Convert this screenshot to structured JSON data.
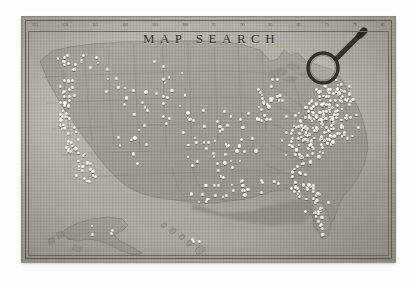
{
  "document": {
    "title": "MAP SEARCH",
    "background_color": "#fdfdfd",
    "plate_color": "#b0ada4",
    "ink_color": "#2e2b25",
    "dot_color": "#ffffff"
  },
  "map": {
    "title": "MAP SEARCH",
    "region_label": "United States",
    "style": "vintage engraved paper map",
    "top_ruler_labels": [
      "125",
      "120",
      "115",
      "110",
      "105",
      "100",
      "95",
      "90",
      "85",
      "80",
      "75",
      "70",
      "65"
    ],
    "bottom_ruler_labels": [
      "",
      "",
      "",
      "",
      "",
      "",
      "",
      "",
      "",
      "",
      "",
      "",
      ""
    ],
    "insets": [
      {
        "name": "alaska-inset",
        "label": "Alaska"
      },
      {
        "name": "hawaii-inset",
        "label": "Hawaii"
      }
    ]
  },
  "magnifier": {
    "icon": "magnifying-glass-icon",
    "label": "Magnifying glass",
    "lens_color": "#2a2823",
    "handle_color": "#2a2823"
  },
  "markers": {
    "legend_label": "Search result locations",
    "marker_icon": "white-pin-dot",
    "count": 428,
    "densest_region": "Northeast",
    "coastal_clusters": [
      "California coast",
      "Eastern seaboard",
      "Florida",
      "Gulf Coast",
      "Great Lakes"
    ]
  },
  "chart_data": {
    "type": "scatter",
    "title": "MAP SEARCH",
    "xlabel": "Longitude (°W)",
    "ylabel": "Latitude (°N)",
    "xlim": [
      -125,
      -65
    ],
    "ylim": [
      24,
      49
    ],
    "grid": true,
    "legend": "none",
    "series": [
      {
        "name": "Search result locations",
        "marker": "white-pin-dot",
        "color": "#ffffff",
        "region_counts": [
          {
            "region": "Northeast",
            "count": 162
          },
          {
            "region": "Southeast",
            "count": 74
          },
          {
            "region": "Midwest",
            "count": 61
          },
          {
            "region": "West Coast",
            "count": 58
          },
          {
            "region": "Mountain West",
            "count": 29
          },
          {
            "region": "South Central",
            "count": 34
          },
          {
            "region": "Alaska / Hawaii",
            "count": 10
          }
        ]
      }
    ]
  }
}
